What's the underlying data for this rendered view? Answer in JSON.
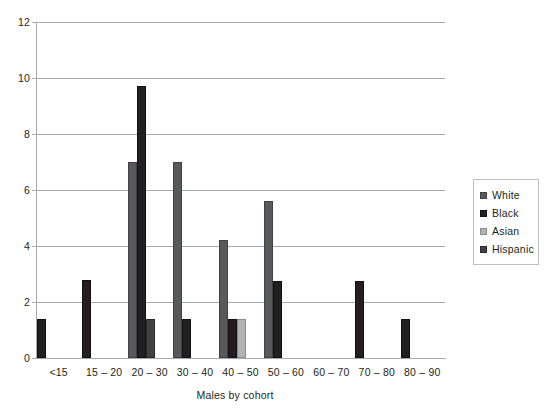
{
  "chart_data": {
    "type": "bar",
    "title": "",
    "xlabel": "Males by cohort",
    "ylabel": "",
    "ylim": [
      0,
      12
    ],
    "ytick_step": 2,
    "yticks": [
      "0",
      "2",
      "4",
      "6",
      "8",
      "10",
      "12"
    ],
    "grid": true,
    "legend_position": "right",
    "categories": [
      "<15",
      "15 – 20",
      "20 – 30",
      "30 – 40",
      "40 – 50",
      "50 – 60",
      "60 – 70",
      "70 – 80",
      "80 – 90"
    ],
    "series": [
      {
        "name": "White",
        "color": "#58595b",
        "values": [
          0,
          0,
          7.0,
          7.0,
          4.2,
          5.6,
          0,
          0,
          0
        ]
      },
      {
        "name": "Black",
        "color": "#231f20",
        "values": [
          1.4,
          2.8,
          9.7,
          1.4,
          1.4,
          2.75,
          0,
          2.75,
          1.4
        ]
      },
      {
        "name": "Asian",
        "color": "#b3b3b3",
        "values": [
          0,
          0,
          0,
          0,
          1.4,
          0,
          0,
          0,
          0
        ]
      },
      {
        "name": "Hispanic",
        "color": "#414042",
        "values": [
          0,
          0,
          1.4,
          0,
          0,
          0,
          0,
          0,
          0
        ]
      }
    ]
  },
  "legend": {
    "items": [
      {
        "label": "White",
        "swatch": "series-white"
      },
      {
        "label": "Black",
        "swatch": "series-black"
      },
      {
        "label": "Asian",
        "swatch": "series-asian"
      },
      {
        "label": "Hispanic",
        "swatch": "series-hispanic"
      }
    ]
  },
  "colors": {
    "axis": "#a7a9ac",
    "grid": "#a7a9ac",
    "text": "#231f20",
    "legend_border": "#bcbec0",
    "background": "#ffffff"
  }
}
